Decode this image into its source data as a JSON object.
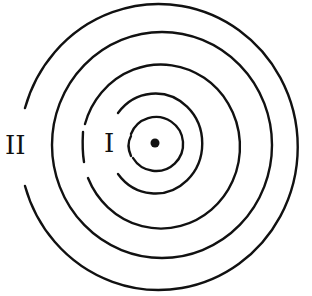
{
  "diagram": {
    "type": "concentric-rings",
    "labels": {
      "inner": "I",
      "outer": "II"
    },
    "center_dot": true,
    "ring_count": 5,
    "colors": {
      "stroke": "#111111",
      "background": "#ffffff"
    }
  }
}
